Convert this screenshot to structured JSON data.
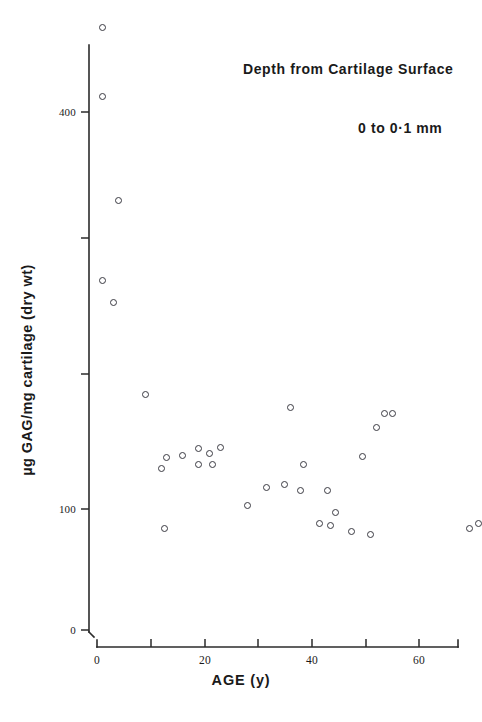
{
  "chart_data": {
    "type": "scatter",
    "title": "",
    "xlabel": "AGE (y)",
    "ylabel": "µg GAG/mg cartilage (dry wt)",
    "xlim": [
      0,
      74
    ],
    "ylim": [
      0,
      490
    ],
    "grid": false,
    "legend": null,
    "annotations": [
      "Depth from Cartilage Surface",
      "0 to 0·1 mm"
    ],
    "x_ticks": [
      0,
      10,
      20,
      30,
      40,
      50,
      60,
      70
    ],
    "x_tick_labels": [
      "0",
      "",
      "20",
      "",
      "40",
      "",
      "60",
      ""
    ],
    "y_ticks": [
      0,
      100,
      200,
      300,
      400
    ],
    "y_tick_labels": [
      "0",
      "100",
      "",
      "",
      "400"
    ],
    "marker": "open-circle",
    "series": [
      {
        "name": "GAG vs age (0–0.1 mm depth)",
        "points": [
          {
            "x": 1.0,
            "y": 465
          },
          {
            "x": 1.0,
            "y": 412
          },
          {
            "x": 4.0,
            "y": 332
          },
          {
            "x": 1.0,
            "y": 270
          },
          {
            "x": 3.0,
            "y": 253
          },
          {
            "x": 9.0,
            "y": 182
          },
          {
            "x": 36.0,
            "y": 172
          },
          {
            "x": 53.5,
            "y": 167
          },
          {
            "x": 55.0,
            "y": 167
          },
          {
            "x": 52.0,
            "y": 156
          },
          {
            "x": 13.0,
            "y": 133
          },
          {
            "x": 16.0,
            "y": 135
          },
          {
            "x": 12.0,
            "y": 125
          },
          {
            "x": 19.0,
            "y": 140
          },
          {
            "x": 21.0,
            "y": 136
          },
          {
            "x": 23.0,
            "y": 141
          },
          {
            "x": 19.0,
            "y": 128
          },
          {
            "x": 21.5,
            "y": 128
          },
          {
            "x": 38.5,
            "y": 128
          },
          {
            "x": 49.5,
            "y": 134
          },
          {
            "x": 31.5,
            "y": 110
          },
          {
            "x": 35.0,
            "y": 112
          },
          {
            "x": 38.0,
            "y": 108
          },
          {
            "x": 43.0,
            "y": 108
          },
          {
            "x": 28.0,
            "y": 96
          },
          {
            "x": 44.5,
            "y": 91
          },
          {
            "x": 41.5,
            "y": 82
          },
          {
            "x": 43.5,
            "y": 81
          },
          {
            "x": 47.5,
            "y": 76
          },
          {
            "x": 12.5,
            "y": 78
          },
          {
            "x": 51.0,
            "y": 74
          },
          {
            "x": 69.5,
            "y": 78
          },
          {
            "x": 71.0,
            "y": 82
          }
        ]
      }
    ]
  },
  "axis": {
    "y_title": "µg GAG/mg cartilage (dry wt)",
    "x_title": "AGE (y)"
  },
  "annotations": {
    "depth_label": "Depth from Cartilage Surface",
    "range_label": "0 to 0·1 mm"
  },
  "colors": {
    "ink": "#1a1a1a",
    "marker_stroke": "#3a3a42",
    "background": "#ffffff"
  }
}
